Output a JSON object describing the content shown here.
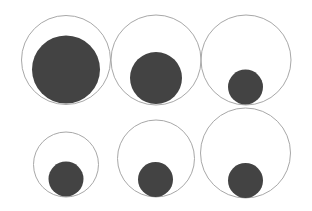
{
  "diagram": {
    "background": "#ffffff",
    "outline_color": "#a8a8a8",
    "fill_color": "#434343",
    "outline_width": 1,
    "groups": [
      {
        "id": "top-1",
        "outer": {
          "cx": 66,
          "cy": 60,
          "r": 44.5
        },
        "inner": {
          "cx": 66,
          "cy": 69.5,
          "r": 34
        }
      },
      {
        "id": "top-2",
        "outer": {
          "cx": 156,
          "cy": 60,
          "r": 45
        },
        "inner": {
          "cx": 156,
          "cy": 78,
          "r": 26
        }
      },
      {
        "id": "top-3",
        "outer": {
          "cx": 246,
          "cy": 60,
          "r": 45
        },
        "inner": {
          "cx": 245.5,
          "cy": 87,
          "r": 17.5
        }
      },
      {
        "id": "bottom-1",
        "outer": {
          "cx": 66,
          "cy": 164.5,
          "r": 32.5
        },
        "inner": {
          "cx": 66,
          "cy": 179,
          "r": 17.5
        }
      },
      {
        "id": "bottom-2",
        "outer": {
          "cx": 156,
          "cy": 158.5,
          "r": 38.5
        },
        "inner": {
          "cx": 155.5,
          "cy": 179.5,
          "r": 17.5
        }
      },
      {
        "id": "bottom-3",
        "outer": {
          "cx": 245.5,
          "cy": 153,
          "r": 45
        },
        "inner": {
          "cx": 245.5,
          "cy": 180.5,
          "r": 17.5
        }
      }
    ]
  }
}
